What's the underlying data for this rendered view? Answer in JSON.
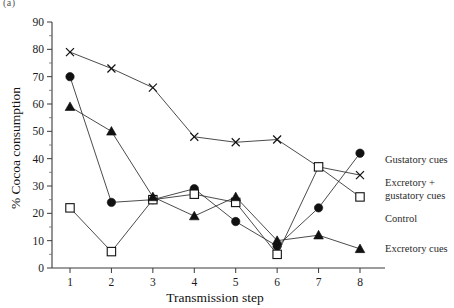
{
  "panel": {
    "tag": "(a)"
  },
  "chart_data": {
    "type": "line",
    "title": "",
    "xlabel": "Transmission step",
    "ylabel": "% Cocoa consumption",
    "x": [
      1,
      2,
      3,
      4,
      5,
      6,
      7,
      8
    ],
    "xticklabels": [
      "1",
      "2",
      "3",
      "4",
      "5",
      "6",
      "7",
      "8"
    ],
    "yticklabels": [
      "0",
      "10",
      "20",
      "30",
      "40",
      "50",
      "60",
      "70",
      "80",
      "90"
    ],
    "xlim": [
      0.6,
      8.5
    ],
    "ylim": [
      0,
      90
    ],
    "grid": false,
    "legend_position": "right",
    "series": [
      {
        "name": "Gustatory cues",
        "marker": "x-cross",
        "fill": "none",
        "values": [
          79,
          73,
          66,
          48,
          46,
          47,
          37,
          34
        ]
      },
      {
        "name": "Excretory + gustatory cues",
        "marker": "filled-circle",
        "fill": "#111111",
        "values": [
          70,
          24,
          25,
          29,
          17,
          8,
          22,
          42
        ]
      },
      {
        "name": "Control",
        "marker": "open-square",
        "fill": "#ffffff",
        "values": [
          22,
          6,
          25,
          27,
          24,
          5,
          37,
          26
        ]
      },
      {
        "name": "Excretory cues",
        "marker": "filled-triangle",
        "fill": "#111111",
        "values": [
          59,
          50,
          26,
          19,
          26,
          10,
          12,
          7
        ]
      }
    ]
  },
  "legend": {
    "entries": [
      {
        "label": "Gustatory cues",
        "marker": "filled-circle"
      },
      {
        "label": "Excretory +",
        "label2": "gustatory cues",
        "marker": "x-cross"
      },
      {
        "label": "Control",
        "marker": "open-square"
      },
      {
        "label": "Excretory cues",
        "marker": "filled-triangle"
      }
    ]
  }
}
